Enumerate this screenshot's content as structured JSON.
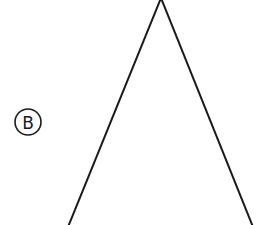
{
  "figure": {
    "label": "B",
    "stroke_color": "#1a1a1a",
    "background": "#ffffff",
    "shape": "triangle-sides",
    "apex": [
      161,
      0
    ],
    "left_base": [
      68,
      225
    ],
    "right_base": [
      253,
      225
    ],
    "label_center": [
      28,
      122
    ],
    "label_radius": 13
  }
}
